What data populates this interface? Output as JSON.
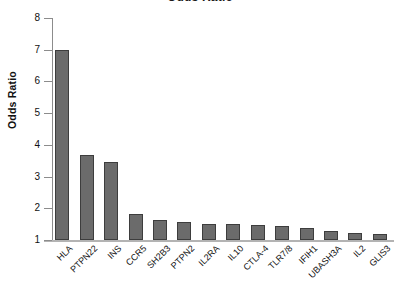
{
  "chart_data": {
    "type": "bar",
    "title": "Odds Ratio",
    "xlabel": "",
    "ylabel": "Odds Ratio",
    "ylim": [
      1,
      8
    ],
    "yticks": [
      1,
      2,
      3,
      4,
      5,
      6,
      7,
      8
    ],
    "ytick_labels": [
      "1",
      "2",
      "3",
      "4",
      "5",
      "6",
      "7",
      "8"
    ],
    "grid": false,
    "legend": false,
    "bar_color": "#6b6b6b",
    "bar_edge_color": "#3d3d3d",
    "axis_color": "#8c8c8c",
    "categories": [
      "HLA",
      "PTPN22",
      "INS",
      "CCR5",
      "SH2B3",
      "PTPN2",
      "IL2RA",
      "IL10",
      "CTLA-4",
      "TLR7/8",
      "IFIH1",
      "UBASH3A",
      "IL2",
      "GLIS3"
    ],
    "values": [
      7.0,
      3.68,
      3.47,
      1.82,
      1.63,
      1.57,
      1.52,
      1.49,
      1.47,
      1.44,
      1.38,
      1.27,
      1.22,
      1.18
    ]
  }
}
